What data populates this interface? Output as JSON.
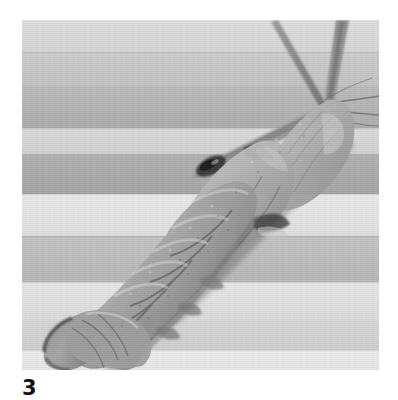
{
  "page": {
    "background_color": "#ffffff",
    "width": 398,
    "height": 400,
    "kind": "scanned-journal-figure-plate"
  },
  "figure": {
    "label": "3",
    "label_position": "below-left",
    "caption": "",
    "photo": {
      "alt_text": "Grayscale photograph of a stomatopod (mantis shrimp) specimen lying diagonally on a light wooden board",
      "orientation": "head-upper-right-tail-lower-left",
      "tone": "grayscale",
      "frame": {
        "x": 22,
        "y": 20,
        "width": 357,
        "height": 350
      }
    }
  },
  "colors": {
    "page_white": "#ffffff",
    "board_light": "#e3e3e3",
    "board_pale": "#dcdcdc",
    "board_mid": "#c4c4c4",
    "board_dark": "#b0b0b0",
    "board_darkest": "#a6a6a6",
    "specimen_body": "#a3a3a3",
    "specimen_light": "#c8c8c8",
    "specimen_shadow": "#6e6e6e",
    "specimen_dark": "#4a4a4a",
    "antenna": "#8a8a8a",
    "label_ink": "#111111"
  },
  "background_bands": [
    {
      "name": "band-1-pale",
      "top": 0,
      "height": 32,
      "color": "#dedede"
    },
    {
      "name": "band-2-mid",
      "top": 32,
      "height": 34,
      "color": "#c9c9c9"
    },
    {
      "name": "band-3-dark",
      "top": 66,
      "height": 42,
      "color": "#b4b4b4"
    },
    {
      "name": "band-4-pale",
      "top": 108,
      "height": 26,
      "color": "#d9d9d9"
    },
    {
      "name": "band-5-dark",
      "top": 134,
      "height": 40,
      "color": "#ababab"
    },
    {
      "name": "band-6-bright",
      "top": 174,
      "height": 42,
      "color": "#e6e6e6"
    },
    {
      "name": "band-7-mid",
      "top": 216,
      "height": 46,
      "color": "#bdbdbd"
    },
    {
      "name": "band-8-bright",
      "top": 262,
      "height": 38,
      "color": "#e4e4e4"
    },
    {
      "name": "band-9-pale",
      "top": 300,
      "height": 30,
      "color": "#d4d4d4"
    },
    {
      "name": "band-10-bright",
      "top": 330,
      "height": 20,
      "color": "#ececec"
    }
  ],
  "board_seams": [
    {
      "name": "seam-1",
      "top": 32
    },
    {
      "name": "seam-2",
      "top": 108
    },
    {
      "name": "seam-3",
      "top": 174
    },
    {
      "name": "seam-4",
      "top": 216
    },
    {
      "name": "seam-5",
      "top": 262
    },
    {
      "name": "seam-6",
      "top": 330
    }
  ],
  "specimen_parts": [
    {
      "name": "antenna-left",
      "description": "long slender antenna angling up-left from head"
    },
    {
      "name": "antenna-right",
      "description": "long slender antenna angling up-right from head"
    },
    {
      "name": "antennal-flagellum",
      "description": "thin whip-like flagella extending to the right margin"
    },
    {
      "name": "carapace",
      "description": "head shield at upper right of the body"
    },
    {
      "name": "eye",
      "description": "dark stalked eye on the carapace"
    },
    {
      "name": "thorax",
      "description": "mid body between carapace and abdomen"
    },
    {
      "name": "abdomen-segments",
      "description": "six overlapping abdominal somites"
    },
    {
      "name": "telson",
      "description": "terminal tail plate at lower left"
    },
    {
      "name": "uropods",
      "description": "tail fan flanking the telson"
    },
    {
      "name": "pleopods",
      "description": "small limbs along the ventral edge"
    }
  ]
}
